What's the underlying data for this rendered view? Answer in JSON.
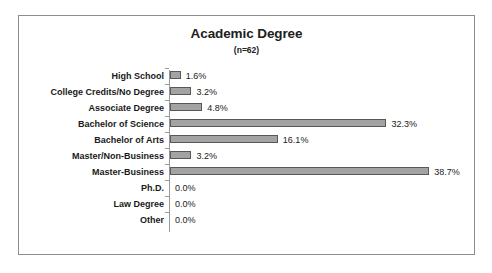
{
  "chart_data": {
    "type": "bar",
    "orientation": "horizontal",
    "title": "Academic Degree",
    "subtitle": "(n=62)",
    "xlabel": "",
    "ylabel": "",
    "xlim": [
      0,
      38.7
    ],
    "grid": false,
    "legend": false,
    "value_suffix": "%",
    "bar_color": "#a3a3a3",
    "bar_border_color": "#585858",
    "frame_color": "#8d8d8d",
    "axis_color": "#9a9a9a",
    "categories": [
      "High School",
      "College Credits/No Degree",
      "Associate Degree",
      "Bachelor of Science",
      "Bachelor of Arts",
      "Master/Non-Business",
      "Master-Business",
      "Ph.D.",
      "Law Degree",
      "Other"
    ],
    "values": [
      1.6,
      3.2,
      4.8,
      32.3,
      16.1,
      3.2,
      38.7,
      0.0,
      0.0,
      0.0
    ],
    "data_labels": [
      "1.6%",
      "3.2%",
      "4.8%",
      "32.3%",
      "16.1%",
      "3.2%",
      "38.7%",
      "0.0%",
      "0.0%",
      "0.0%"
    ]
  }
}
